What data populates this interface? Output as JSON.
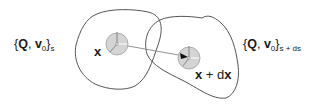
{
  "diagram": {
    "type": "continuum-configuration-mapping",
    "left_set": {
      "open_brace": "{",
      "Q": "Q",
      "comma": ", ",
      "v": "v",
      "v_sub": "0",
      "close_brace": "}",
      "subscript": "s"
    },
    "right_set": {
      "open_brace": "{",
      "Q": "Q",
      "comma": ", ",
      "v": "v",
      "v_sub": "0",
      "close_brace": "}",
      "subscript": "s + ds"
    },
    "point_left": {
      "label": "x"
    },
    "point_right": {
      "label_x": "x",
      "label_plus": " + ",
      "label_d": "d",
      "label_x2": "x"
    },
    "colors": {
      "outline": "#555555",
      "circle_fill": "#d4d4d4",
      "circle_stroke": "#9a9a9a",
      "arrow": "#777777",
      "text": "#1a1a1a"
    }
  }
}
